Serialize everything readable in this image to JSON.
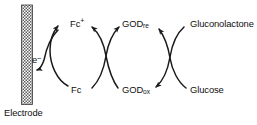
{
  "diagram": {
    "type": "reaction-cycle-schematic",
    "colors": {
      "stroke": "#1a1a1a",
      "text": "#101010",
      "background": "#ffffff",
      "electrode_fill": "#9a9a9a"
    },
    "electrode": {
      "label": "Electrode",
      "pattern": "crosshatch"
    },
    "species": {
      "electron": "e",
      "electron_charge": "–",
      "mediator_oxidized": "Fc",
      "mediator_oxidized_charge": "+",
      "mediator_reduced": "Fc",
      "enzyme_reduced": "GOD",
      "enzyme_reduced_sub": "re",
      "enzyme_oxidized": "GOD",
      "enzyme_oxidized_sub": "ox",
      "product": "Gluconolactone",
      "substrate": "Glucose"
    },
    "cycles": [
      {
        "name": "mediator-cycle",
        "top_species": "Fc+",
        "bottom_species": "Fc",
        "direction": "counter-clockwise"
      },
      {
        "name": "enzyme-cycle",
        "top_species": "GODre",
        "bottom_species": "GODox",
        "direction": "crossed"
      },
      {
        "name": "substrate-cycle",
        "top_species": "Gluconolactone",
        "bottom_species": "Glucose",
        "direction": "crossed"
      }
    ]
  }
}
